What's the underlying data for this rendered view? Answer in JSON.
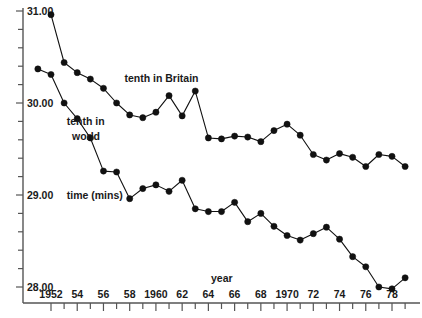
{
  "chart_data": {
    "type": "line",
    "title": "",
    "xlabel": "year",
    "ylabel": "time (mins)",
    "xlim": [
      1951,
      1979.5
    ],
    "ylim": [
      27.8,
      31.12
    ],
    "grid": false,
    "legend_position": "inline-annotation",
    "x_tick_step": 1,
    "x_labeled_step": 2,
    "x_tick_labels": [
      "1952",
      "54",
      "56",
      "58",
      "1960",
      "62",
      "64",
      "66",
      "68",
      "1970",
      "72",
      "74",
      "76",
      "78"
    ],
    "x_tick_values": [
      1952,
      1954,
      1956,
      1958,
      1960,
      1962,
      1964,
      1966,
      1968,
      1970,
      1972,
      1974,
      1976,
      1978
    ],
    "y_tick_labels": [
      "31.00",
      "30.00",
      "29.00",
      "28.00"
    ],
    "y_tick_values": [
      31.0,
      30.0,
      29.0,
      28.0
    ],
    "y_minor_step": 0.2,
    "series": [
      {
        "name": "tenth in Britain",
        "label": "tenth in Britain",
        "color": "#111111",
        "x": [
          1952,
          1953,
          1954,
          1955,
          1956,
          1957,
          1958,
          1959,
          1960,
          1961,
          1962,
          1963,
          1964,
          1965,
          1966,
          1967,
          1968,
          1969,
          1970,
          1971,
          1972,
          1973,
          1974,
          1975,
          1976,
          1977,
          1978,
          1979
        ],
        "values": [
          30.96,
          30.44,
          30.33,
          30.26,
          30.16,
          30.0,
          29.87,
          29.84,
          29.9,
          30.08,
          29.86,
          30.13,
          29.62,
          29.61,
          29.64,
          29.63,
          29.58,
          29.7,
          29.77,
          29.65,
          29.44,
          29.38,
          29.45,
          29.41,
          29.31,
          29.44,
          29.42,
          29.31
        ]
      },
      {
        "name": "tenth in world",
        "label": "tenth in world",
        "color": "#111111",
        "x": [
          1951,
          1952,
          1953,
          1954,
          1955,
          1956,
          1957,
          1958,
          1959,
          1960,
          1961,
          1962,
          1963,
          1964,
          1965,
          1966,
          1967,
          1968,
          1969,
          1970,
          1971,
          1972,
          1973,
          1974,
          1975,
          1976,
          1977,
          1978,
          1979
        ],
        "values": [
          30.37,
          30.31,
          30.0,
          29.83,
          29.62,
          29.26,
          29.25,
          28.96,
          29.07,
          29.11,
          29.04,
          29.16,
          28.85,
          28.82,
          28.82,
          28.92,
          28.71,
          28.8,
          28.66,
          28.56,
          28.51,
          28.58,
          28.65,
          28.52,
          28.33,
          28.22,
          28.0,
          27.98,
          28.1
        ]
      }
    ],
    "annotations": [
      {
        "text": "tenth in Britain",
        "x": 1957.6,
        "y": 30.23
      },
      {
        "text": "tenth in",
        "x": 1953.2,
        "y": 29.76
      },
      {
        "text": "world",
        "x": 1953.6,
        "y": 29.6
      },
      {
        "text": "time (mins)",
        "x": 1953.2,
        "y": 28.96
      },
      {
        "text": "year",
        "x": 1964.2,
        "y": 28.05
      }
    ]
  }
}
